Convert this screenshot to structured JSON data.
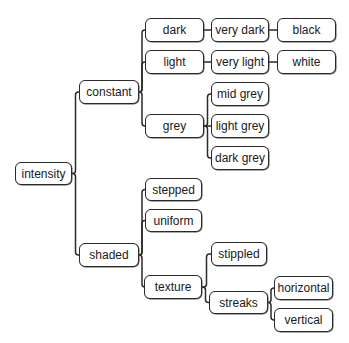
{
  "diagram": {
    "type": "tree",
    "root": "intensity",
    "nodes": [
      {
        "id": "intensity",
        "label": "intensity",
        "x": 15,
        "y": 162,
        "w": 57,
        "h": 23
      },
      {
        "id": "constant",
        "label": "constant",
        "x": 79,
        "y": 80,
        "w": 60,
        "h": 24
      },
      {
        "id": "shaded",
        "label": "shaded",
        "x": 79,
        "y": 243,
        "w": 60,
        "h": 24
      },
      {
        "id": "dark",
        "label": "dark",
        "x": 145,
        "y": 18,
        "w": 59,
        "h": 24
      },
      {
        "id": "light",
        "label": "light",
        "x": 145,
        "y": 50,
        "w": 59,
        "h": 24
      },
      {
        "id": "grey",
        "label": "grey",
        "x": 145,
        "y": 114,
        "w": 59,
        "h": 24
      },
      {
        "id": "very_dark",
        "label": "very dark",
        "x": 211,
        "y": 18,
        "w": 58,
        "h": 24
      },
      {
        "id": "very_light",
        "label": "very light",
        "x": 211,
        "y": 50,
        "w": 58,
        "h": 24
      },
      {
        "id": "black",
        "label": "black",
        "x": 277,
        "y": 18,
        "w": 59,
        "h": 24
      },
      {
        "id": "white",
        "label": "white",
        "x": 277,
        "y": 50,
        "w": 59,
        "h": 24
      },
      {
        "id": "mid_grey",
        "label": "mid grey",
        "x": 211,
        "y": 82,
        "w": 58,
        "h": 24
      },
      {
        "id": "light_grey",
        "label": "light grey",
        "x": 211,
        "y": 114,
        "w": 58,
        "h": 24
      },
      {
        "id": "dark_grey",
        "label": "dark grey",
        "x": 211,
        "y": 146,
        "w": 58,
        "h": 24
      },
      {
        "id": "stepped",
        "label": "stepped",
        "x": 145,
        "y": 178,
        "w": 57,
        "h": 23
      },
      {
        "id": "uniform",
        "label": "uniform",
        "x": 145,
        "y": 209,
        "w": 57,
        "h": 23
      },
      {
        "id": "texture",
        "label": "texture",
        "x": 144,
        "y": 275,
        "w": 58,
        "h": 24
      },
      {
        "id": "stippled",
        "label": "stippled",
        "x": 211,
        "y": 242,
        "w": 56,
        "h": 24
      },
      {
        "id": "streaks",
        "label": "streaks",
        "x": 209,
        "y": 291,
        "w": 59,
        "h": 23
      },
      {
        "id": "horizontal",
        "label": "horizontal",
        "x": 274,
        "y": 276,
        "w": 59,
        "h": 24
      },
      {
        "id": "vertical",
        "label": "vertical",
        "x": 274,
        "y": 308,
        "w": 59,
        "h": 24
      }
    ],
    "edges": [
      [
        "intensity",
        "constant"
      ],
      [
        "intensity",
        "shaded"
      ],
      [
        "constant",
        "dark"
      ],
      [
        "constant",
        "light"
      ],
      [
        "constant",
        "grey"
      ],
      [
        "dark",
        "very_dark"
      ],
      [
        "very_dark",
        "black"
      ],
      [
        "light",
        "very_light"
      ],
      [
        "very_light",
        "white"
      ],
      [
        "grey",
        "mid_grey"
      ],
      [
        "grey",
        "light_grey"
      ],
      [
        "grey",
        "dark_grey"
      ],
      [
        "shaded",
        "stepped"
      ],
      [
        "shaded",
        "uniform"
      ],
      [
        "shaded",
        "texture"
      ],
      [
        "texture",
        "stippled"
      ],
      [
        "texture",
        "streaks"
      ],
      [
        "streaks",
        "horizontal"
      ],
      [
        "streaks",
        "vertical"
      ]
    ],
    "line_color": "#2a2a2a"
  }
}
